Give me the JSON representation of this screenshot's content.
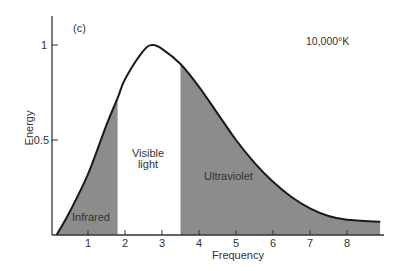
{
  "chart_data": {
    "type": "area",
    "title": "(c)",
    "annotation_temperature": "10,000°K",
    "xlabel": "Frequency",
    "ylabel": "Energy",
    "xlim": [
      0,
      9
    ],
    "ylim": [
      0,
      1.1
    ],
    "x_ticks": [
      1,
      2,
      3,
      4,
      5,
      6,
      7,
      8
    ],
    "y_ticks": [
      0.5,
      1
    ],
    "y_tick_labels": [
      "0.5",
      "1"
    ],
    "grid": false,
    "series": [
      {
        "name": "Blackbody spectrum 10,000 K",
        "x": [
          0.15,
          0.5,
          1.0,
          1.5,
          1.8,
          2.0,
          2.5,
          2.75,
          3.0,
          3.5,
          4.0,
          4.5,
          5.0,
          5.5,
          6.0,
          6.5,
          7.0,
          7.5,
          8.0,
          8.9
        ],
        "values": [
          0.0,
          0.12,
          0.32,
          0.58,
          0.72,
          0.82,
          0.97,
          1.0,
          0.98,
          0.9,
          0.78,
          0.64,
          0.5,
          0.38,
          0.28,
          0.2,
          0.14,
          0.1,
          0.08,
          0.07
        ]
      }
    ],
    "regions": [
      {
        "name": "Infrared",
        "x_start": 0.15,
        "x_end": 1.8,
        "shaded": true
      },
      {
        "name": "Visible light",
        "x_start": 1.8,
        "x_end": 3.5,
        "shaded": false
      },
      {
        "name": "Ultraviolet",
        "x_start": 3.5,
        "x_end": 8.9,
        "shaded": true
      }
    ],
    "colors": {
      "shade": "#8c8c8c",
      "curve": "#1a1a1a",
      "axis": "#333333"
    }
  },
  "labels": {
    "panel": "(c)",
    "temperature": "10,000°K",
    "infrared": "Infrared",
    "visible_line1": "Visible",
    "visible_line2": "light",
    "ultraviolet": "Ultraviolet",
    "xlabel": "Frequency",
    "ylabel": "Energy",
    "ytick_1": "1",
    "ytick_05": "0.5",
    "xticks": [
      "1",
      "2",
      "3",
      "4",
      "5",
      "6",
      "7",
      "8"
    ]
  }
}
